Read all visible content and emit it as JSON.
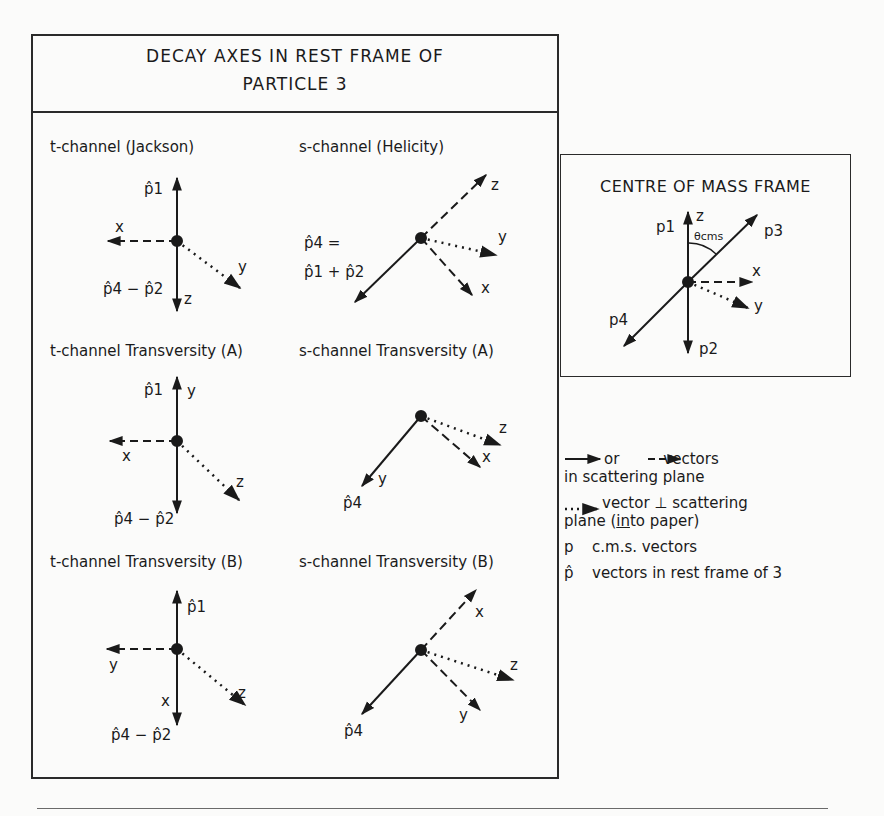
{
  "main_frame": {
    "title_line1": "DECAY AXES IN REST FRAME OF",
    "title_line2": "PARTICLE 3",
    "panels": [
      {
        "id": "t-jackson",
        "title": "t-channel (Jackson)",
        "labels": {
          "up": "p̂1",
          "left": "x",
          "dotted": "y",
          "down": "z",
          "down_vec": "p̂4 − p̂2"
        }
      },
      {
        "id": "s-helicity",
        "title": "s-channel (Helicity)",
        "labels": {
          "upright": "z",
          "dotted": "y",
          "dashed_down": "x",
          "solid_eq1": "p̂4 =",
          "solid_eq2": "p̂1 + p̂2"
        }
      },
      {
        "id": "t-transversity-a",
        "title": "t-channel Transversity (A)",
        "labels": {
          "up_vec": "p̂1",
          "up": "y",
          "left": "x",
          "dotted": "z",
          "down_vec": "p̂4 − p̂2"
        }
      },
      {
        "id": "s-transversity-a",
        "title": "s-channel Transversity (A)",
        "labels": {
          "dotted": "z",
          "dashed": "x",
          "solid": "y",
          "solid_vec": "p̂4"
        }
      },
      {
        "id": "t-transversity-b",
        "title": "t-channel Transversity (B)",
        "labels": {
          "up_vec": "p̂1",
          "left": "y",
          "down": "x",
          "dotted": "z",
          "down_vec": "p̂4 − p̂2"
        }
      },
      {
        "id": "s-transversity-b",
        "title": "s-channel Transversity (B)",
        "labels": {
          "dashed_up": "x",
          "dotted": "z",
          "dashed_down": "y",
          "solid_vec": "p̂4"
        }
      }
    ]
  },
  "cm_frame": {
    "title": "CENTRE OF MASS FRAME",
    "labels": {
      "p1": "p1",
      "z": "z",
      "theta": "θcms",
      "p3": "p3",
      "x": "x",
      "y": "y",
      "p4": "p4",
      "p2": "p2"
    }
  },
  "legend": {
    "row1_or": "or",
    "row1_text": "vectors",
    "row1_line2": "in scattering plane",
    "row2_text": "vector ⊥ scattering",
    "row2_line2_pre": "plane (",
    "row2_line2_u": "in",
    "row2_line2_post": "to paper)",
    "row3_sym": "p",
    "row3_text": "c.m.s. vectors",
    "row4_sym": "p̂",
    "row4_text": "vectors in rest frame of 3"
  }
}
